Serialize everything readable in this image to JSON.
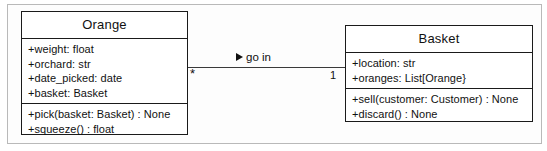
{
  "diagram": {
    "type": "uml-class-diagram",
    "classes": [
      {
        "name": "Orange",
        "attributes": [
          "+weight: float",
          "+orchard: str",
          "+date_picked: date",
          "+basket: Basket"
        ],
        "methods": [
          "+pick(basket: Basket) : None",
          "+squeeze() : float"
        ]
      },
      {
        "name": "Basket",
        "attributes": [
          "+location: str",
          "+oranges: List[Orange}"
        ],
        "methods": [
          "+sell(customer: Customer) : None",
          "+discard() : None"
        ]
      }
    ],
    "association": {
      "label": "go in",
      "direction_marker": "solid-right-triangle",
      "source_multiplicity": "*",
      "target_multiplicity": "1"
    },
    "colors": {
      "line": "#1a1a1a",
      "text": "#111111",
      "frame": "#b9b9b9",
      "background": "#ffffff"
    }
  }
}
